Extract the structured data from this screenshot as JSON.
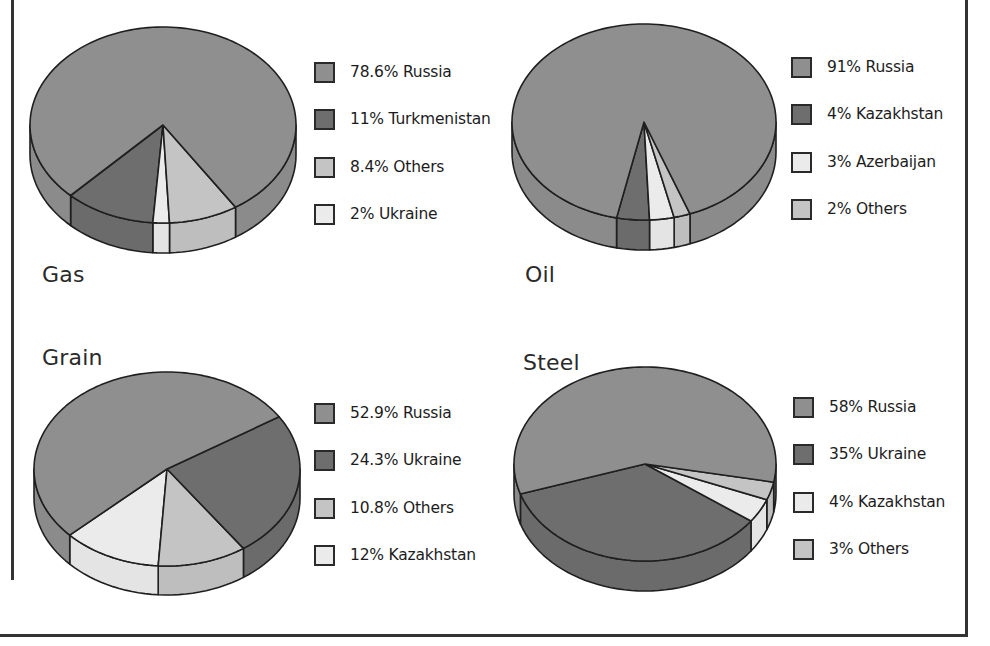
{
  "colors": {
    "russia": "#8f8f8f",
    "dark": "#6e6e6e",
    "light": "#ebebeb",
    "others": "#c4c4c4",
    "outline": "#1f1f1f"
  },
  "chart_data": [
    {
      "type": "pie",
      "title": "Gas",
      "categories": [
        "Russia",
        "Turkmenistan",
        "Others",
        "Ukraine"
      ],
      "values": [
        78.6,
        11,
        8.4,
        2
      ],
      "legend": [
        "78.6% Russia",
        "11% Turkmenistan",
        "8.4% Others",
        "2% Ukraine"
      ],
      "legend_position": "right"
    },
    {
      "type": "pie",
      "title": "Oil",
      "categories": [
        "Russia",
        "Kazakhstan",
        "Azerbaijan",
        "Others"
      ],
      "values": [
        91,
        4,
        3,
        2
      ],
      "legend": [
        "91% Russia",
        "4% Kazakhstan",
        "3% Azerbaijan",
        "2% Others"
      ],
      "legend_position": "right"
    },
    {
      "type": "pie",
      "title": "Grain",
      "categories": [
        "Russia",
        "Ukraine",
        "Others",
        "Kazakhstan"
      ],
      "values": [
        52.9,
        24.3,
        10.8,
        12
      ],
      "legend": [
        "52.9% Russia",
        "24.3% Ukraine",
        "10.8% Others",
        "12% Kazakhstan"
      ],
      "legend_position": "right"
    },
    {
      "type": "pie",
      "title": "Steel",
      "categories": [
        "Russia",
        "Ukraine",
        "Kazakhstan",
        "Others"
      ],
      "values": [
        58,
        35,
        4,
        3
      ],
      "legend": [
        "58% Russia",
        "35% Ukraine",
        "4% Kazakhstan",
        "3% Others"
      ],
      "legend_position": "right"
    }
  ],
  "charts": {
    "gas": {
      "title": "Gas",
      "legend": [
        {
          "label": "78.6% Russia",
          "swatch": "russia"
        },
        {
          "label": "11% Turkmenistan",
          "swatch": "dark"
        },
        {
          "label": "8.4% Others",
          "swatch": "others"
        },
        {
          "label": "2% Ukraine",
          "swatch": "light"
        }
      ]
    },
    "oil": {
      "title": "Oil",
      "legend": [
        {
          "label": "91% Russia",
          "swatch": "russia"
        },
        {
          "label": "4% Kazakhstan",
          "swatch": "dark"
        },
        {
          "label": "3% Azerbaijan",
          "swatch": "light"
        },
        {
          "label": "2% Others",
          "swatch": "others"
        }
      ]
    },
    "grain": {
      "title": "Grain",
      "legend": [
        {
          "label": "52.9% Russia",
          "swatch": "russia"
        },
        {
          "label": "24.3% Ukraine",
          "swatch": "dark"
        },
        {
          "label": "10.8% Others",
          "swatch": "others"
        },
        {
          "label": "12% Kazakhstan",
          "swatch": "light"
        }
      ]
    },
    "steel": {
      "title": "Steel",
      "legend": [
        {
          "label": "58% Russia",
          "swatch": "russia"
        },
        {
          "label": "35% Ukraine",
          "swatch": "dark"
        },
        {
          "label": "4% Kazakhstan",
          "swatch": "light"
        },
        {
          "label": "3% Others",
          "swatch": "others"
        }
      ]
    }
  },
  "geometry": [
    {
      "key": "gas",
      "cx": 163,
      "cy": 125,
      "rx": 133,
      "ry": 98,
      "depth": 30,
      "slices": [
        {
          "value": 11,
          "swatch": "dark"
        },
        {
          "value": 2,
          "swatch": "light"
        },
        {
          "value": 8.4,
          "swatch": "others"
        },
        {
          "value": 78.6,
          "swatch": "russia"
        }
      ],
      "start_deg": 134
    },
    {
      "key": "oil",
      "cx": 644,
      "cy": 122,
      "rx": 132,
      "ry": 98,
      "depth": 30,
      "slices": [
        {
          "value": 4,
          "swatch": "dark"
        },
        {
          "value": 3,
          "swatch": "light"
        },
        {
          "value": 2,
          "swatch": "others"
        },
        {
          "value": 91,
          "swatch": "russia"
        }
      ],
      "start_deg": 102
    },
    {
      "key": "grain",
      "cx": 167,
      "cy": 469,
      "rx": 133,
      "ry": 97,
      "depth": 29,
      "slices": [
        {
          "value": 12,
          "swatch": "light"
        },
        {
          "value": 10.8,
          "swatch": "others"
        },
        {
          "value": 24.3,
          "swatch": "dark"
        },
        {
          "value": 52.9,
          "swatch": "russia"
        }
      ],
      "start_deg": 137
    },
    {
      "key": "steel",
      "cx": 645,
      "cy": 464,
      "rx": 131,
      "ry": 97,
      "depth": 30,
      "slices": [
        {
          "value": 35,
          "swatch": "dark"
        },
        {
          "value": 4,
          "swatch": "light"
        },
        {
          "value": 3,
          "swatch": "others"
        },
        {
          "value": 58,
          "swatch": "russia"
        }
      ],
      "start_deg": 162
    }
  ]
}
